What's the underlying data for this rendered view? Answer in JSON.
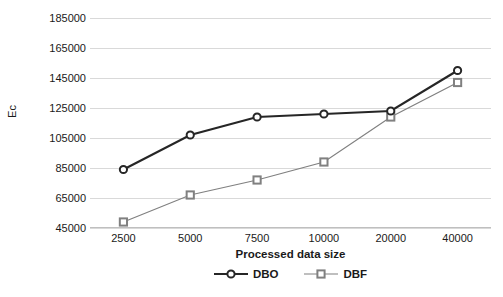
{
  "chart_data": {
    "type": "line",
    "title": "",
    "xlabel": "Processed data size",
    "ylabel": "Ec",
    "categories": [
      "2500",
      "5000",
      "7500",
      "10000",
      "20000",
      "40000"
    ],
    "ytick_labels": [
      "185000",
      "165000",
      "145000",
      "125000",
      "105000",
      "85000",
      "65000",
      "45000"
    ],
    "ylim": [
      45000,
      185000
    ],
    "ytick_step": 20000,
    "grid": true,
    "legend_position": "bottom-center",
    "series": [
      {
        "name": "DBO",
        "marker": "circle",
        "color": "#262626",
        "line_width": 2.2,
        "values": [
          84000,
          107000,
          119000,
          121000,
          123000,
          150000
        ]
      },
      {
        "name": "DBF",
        "marker": "square",
        "color": "#808080",
        "line_width": 1.2,
        "values": [
          49000,
          67000,
          77000,
          89000,
          119000,
          142000
        ]
      }
    ]
  },
  "legend": {
    "items": [
      {
        "label": "DBO"
      },
      {
        "label": "DBF"
      }
    ]
  }
}
